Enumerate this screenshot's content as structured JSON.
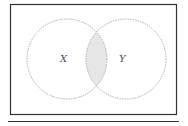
{
  "diagram": {
    "type": "venn",
    "sets": [
      {
        "label": "X",
        "cx": 67,
        "cy": 59,
        "r": 40
      },
      {
        "label": "Y",
        "cx": 126,
        "cy": 59,
        "r": 40
      }
    ],
    "shaded_region": "X ∩ Y",
    "colors": {
      "frame": "#333333",
      "circle_stroke": "#9a9a9a",
      "shade": "#e6e6e6",
      "underline": "#333333"
    }
  }
}
